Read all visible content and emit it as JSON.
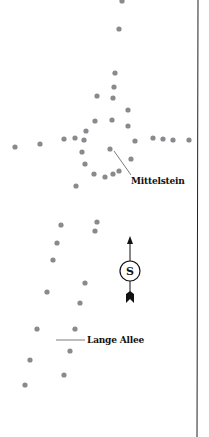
{
  "map": {
    "dot_color": "#8a8a8e",
    "border_color": "#222222",
    "points": [
      [
        122,
        1
      ],
      [
        119,
        29
      ],
      [
        115,
        73
      ],
      [
        114,
        87
      ],
      [
        97,
        96
      ],
      [
        113,
        98
      ],
      [
        128,
        110
      ],
      [
        95,
        121
      ],
      [
        112,
        120
      ],
      [
        128,
        126
      ],
      [
        86,
        131
      ],
      [
        64,
        139
      ],
      [
        75,
        138
      ],
      [
        84,
        140
      ],
      [
        135,
        141
      ],
      [
        153,
        138
      ],
      [
        163,
        139
      ],
      [
        173,
        140
      ],
      [
        189,
        140
      ],
      [
        15,
        147
      ],
      [
        40,
        144
      ],
      [
        110,
        149
      ],
      [
        82,
        152
      ],
      [
        85,
        164
      ],
      [
        131,
        159
      ],
      [
        94,
        174
      ],
      [
        105,
        177
      ],
      [
        113,
        174
      ],
      [
        119,
        171
      ],
      [
        76,
        186
      ],
      [
        61,
        225
      ],
      [
        97,
        222
      ],
      [
        95,
        231
      ],
      [
        57,
        243
      ],
      [
        53,
        260
      ],
      [
        85,
        283
      ],
      [
        47,
        292
      ],
      [
        80,
        303
      ],
      [
        37,
        329
      ],
      [
        75,
        329
      ],
      [
        70,
        351
      ],
      [
        30,
        360
      ],
      [
        64,
        375
      ],
      [
        25,
        385
      ]
    ],
    "labels": [
      {
        "text": "Mittelstein",
        "x": 131,
        "y": 176
      },
      {
        "text": "Lange Allee",
        "x": 87,
        "y": 336
      }
    ],
    "compass": {
      "letter": "S",
      "cx": 130,
      "cy": 271
    }
  }
}
